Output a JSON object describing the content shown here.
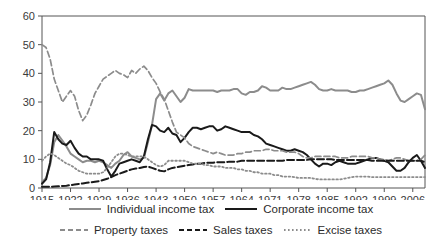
{
  "chart_data": {
    "type": "line",
    "title": "",
    "subtitle": "",
    "xlabel": "",
    "ylabel": "",
    "xlim": [
      1915,
      2009
    ],
    "ylim": [
      0,
      60
    ],
    "grid": false,
    "legend_position": "bottom",
    "y_ticks": [
      0,
      10,
      20,
      30,
      40,
      50,
      60
    ],
    "x_ticks": [
      1915,
      1922,
      1929,
      1936,
      1943,
      1950,
      1957,
      1964,
      1971,
      1978,
      1985,
      1992,
      1999,
      2006
    ],
    "x_tick_labels": [
      "1915",
      "1922",
      "1929",
      "1936",
      "1943",
      "1950",
      "1957",
      "1964",
      "1971",
      "1978",
      "1985",
      "1992",
      "1999",
      "2006"
    ],
    "y_tick_labels": [
      "0",
      "10",
      "20",
      "30",
      "40",
      "50",
      "60"
    ],
    "x": [
      1915,
      1916,
      1917,
      1918,
      1919,
      1920,
      1921,
      1922,
      1923,
      1924,
      1925,
      1926,
      1927,
      1928,
      1929,
      1930,
      1931,
      1932,
      1933,
      1934,
      1935,
      1936,
      1937,
      1938,
      1939,
      1940,
      1941,
      1942,
      1943,
      1944,
      1945,
      1946,
      1947,
      1948,
      1949,
      1950,
      1951,
      1952,
      1953,
      1954,
      1955,
      1956,
      1957,
      1958,
      1959,
      1960,
      1961,
      1962,
      1963,
      1964,
      1965,
      1966,
      1967,
      1968,
      1969,
      1970,
      1971,
      1972,
      1973,
      1974,
      1975,
      1976,
      1977,
      1978,
      1979,
      1980,
      1981,
      1982,
      1983,
      1984,
      1985,
      1986,
      1987,
      1988,
      1989,
      1990,
      1991,
      1992,
      1993,
      1994,
      1995,
      1996,
      1997,
      1998,
      1999,
      2000,
      2001,
      2002,
      2003,
      2004,
      2005,
      2006,
      2007,
      2008,
      2009
    ],
    "series": [
      {
        "name": "Individual income tax",
        "style": "solid",
        "color": "#8c8c8c",
        "width": 2,
        "values": [
          2.0,
          3.5,
          8.0,
          16.0,
          18.5,
          16.5,
          14.5,
          12.0,
          11.0,
          10.0,
          9.0,
          9.5,
          9.5,
          9.0,
          9.5,
          9.0,
          8.0,
          7.0,
          8.5,
          9.5,
          11.5,
          12.5,
          11.0,
          10.5,
          10.0,
          10.5,
          16.0,
          22.0,
          31.0,
          33.0,
          30.5,
          33.0,
          34.0,
          32.0,
          30.0,
          31.5,
          34.5,
          34.0,
          34.0,
          34.0,
          34.0,
          34.0,
          34.0,
          33.5,
          34.0,
          34.0,
          34.0,
          34.5,
          34.5,
          33.0,
          32.5,
          33.5,
          33.5,
          34.0,
          35.5,
          35.0,
          34.0,
          34.0,
          34.0,
          35.0,
          34.5,
          34.5,
          35.0,
          35.5,
          36.0,
          36.5,
          37.0,
          36.0,
          34.5,
          34.0,
          34.0,
          34.5,
          34.0,
          34.0,
          34.0,
          34.0,
          33.5,
          33.5,
          34.0,
          34.0,
          34.5,
          35.0,
          35.5,
          36.0,
          36.5,
          37.5,
          36.0,
          33.0,
          30.5,
          30.0,
          31.0,
          32.0,
          33.0,
          32.5,
          27.5
        ]
      },
      {
        "name": "Corporate income tax",
        "style": "solid",
        "color": "#1a1a1a",
        "width": 2,
        "values": [
          1.5,
          3.0,
          9.0,
          19.5,
          17.0,
          15.5,
          15.0,
          16.5,
          14.0,
          12.0,
          11.0,
          11.0,
          10.0,
          10.0,
          10.0,
          9.5,
          6.5,
          4.0,
          6.0,
          8.5,
          9.0,
          9.5,
          10.0,
          9.5,
          9.0,
          11.0,
          17.0,
          22.0,
          21.5,
          20.0,
          19.5,
          21.0,
          19.0,
          18.5,
          16.0,
          17.5,
          19.5,
          21.0,
          21.0,
          20.5,
          21.0,
          21.5,
          21.5,
          20.0,
          20.5,
          21.5,
          21.0,
          20.5,
          20.0,
          19.5,
          19.5,
          19.5,
          18.5,
          18.0,
          17.0,
          15.5,
          15.0,
          14.5,
          14.0,
          13.5,
          13.0,
          13.0,
          13.5,
          13.0,
          12.5,
          11.5,
          10.0,
          8.5,
          7.5,
          8.5,
          8.5,
          8.0,
          9.0,
          9.5,
          9.0,
          8.5,
          8.5,
          8.5,
          9.0,
          9.5,
          10.0,
          10.5,
          10.5,
          10.0,
          9.5,
          9.0,
          7.5,
          6.0,
          6.0,
          7.0,
          9.0,
          10.5,
          11.5,
          9.5,
          7.0
        ]
      },
      {
        "name": "Property taxes",
        "style": "dashed",
        "color": "#8c8c8c",
        "width": 1.7,
        "values": [
          50.0,
          49.0,
          45.0,
          38.0,
          34.0,
          30.0,
          32.0,
          34.0,
          32.0,
          27.0,
          23.5,
          25.5,
          29.0,
          33.0,
          35.5,
          38.0,
          39.0,
          40.0,
          41.0,
          40.0,
          39.5,
          38.5,
          41.0,
          40.0,
          41.5,
          42.5,
          41.0,
          38.5,
          36.5,
          33.5,
          31.0,
          27.0,
          23.0,
          19.5,
          18.5,
          17.5,
          15.5,
          14.5,
          14.0,
          13.5,
          13.0,
          12.5,
          12.0,
          12.5,
          12.0,
          11.5,
          11.5,
          11.5,
          12.0,
          12.0,
          12.5,
          12.5,
          13.0,
          13.0,
          13.0,
          13.5,
          13.5,
          13.0,
          13.0,
          13.0,
          12.5,
          12.5,
          12.5,
          12.0,
          11.0,
          10.5,
          10.5,
          11.0,
          11.0,
          11.0,
          11.0,
          11.0,
          11.0,
          10.5,
          10.5,
          10.5,
          11.0,
          11.0,
          11.0,
          11.0,
          11.0,
          10.5,
          10.5,
          10.0,
          10.0,
          9.5,
          10.0,
          10.5,
          10.5,
          10.0,
          9.5,
          9.5,
          9.5,
          10.0,
          11.5
        ]
      },
      {
        "name": "Sales taxes",
        "style": "dashed-heavy",
        "color": "#1a1a1a",
        "width": 2,
        "values": [
          0.4,
          0.4,
          0.4,
          0.5,
          0.6,
          0.7,
          0.8,
          1.0,
          1.2,
          1.4,
          1.6,
          1.8,
          2.0,
          2.2,
          2.4,
          2.8,
          3.2,
          3.8,
          4.5,
          5.0,
          5.5,
          6.0,
          6.5,
          6.8,
          7.0,
          7.3,
          7.5,
          7.0,
          6.5,
          6.0,
          5.8,
          6.5,
          7.0,
          7.2,
          7.5,
          7.8,
          8.0,
          8.2,
          8.5,
          8.5,
          8.8,
          8.8,
          8.8,
          9.0,
          9.0,
          9.0,
          9.2,
          9.2,
          9.2,
          9.5,
          9.5,
          9.5,
          9.5,
          9.5,
          9.5,
          9.5,
          9.5,
          9.5,
          9.5,
          9.5,
          9.8,
          9.8,
          9.8,
          9.8,
          9.8,
          9.8,
          10.0,
          10.0,
          10.0,
          10.0,
          10.0,
          10.0,
          9.8,
          9.8,
          9.8,
          9.8,
          9.8,
          9.8,
          9.8,
          9.8,
          9.8,
          9.5,
          9.5,
          9.5,
          9.5,
          9.5,
          9.5,
          9.5,
          9.5,
          9.5,
          9.5,
          9.5,
          9.5,
          9.5,
          9.0
        ]
      },
      {
        "name": "Excise taxes",
        "style": "dotted",
        "color": "#8c8c8c",
        "width": 1.8,
        "values": [
          9.5,
          11.0,
          12.0,
          11.5,
          10.5,
          9.5,
          8.5,
          8.0,
          7.0,
          6.0,
          5.5,
          5.0,
          5.0,
          5.0,
          5.0,
          5.5,
          7.0,
          9.0,
          11.0,
          12.0,
          12.0,
          11.5,
          11.0,
          11.0,
          11.0,
          11.0,
          10.0,
          9.0,
          8.0,
          7.5,
          8.0,
          9.5,
          9.5,
          9.5,
          9.5,
          9.5,
          9.0,
          8.5,
          8.5,
          8.5,
          8.0,
          8.0,
          7.5,
          7.5,
          7.5,
          7.0,
          7.0,
          7.0,
          6.5,
          6.5,
          6.0,
          6.0,
          5.5,
          5.5,
          5.0,
          5.0,
          5.0,
          4.5,
          4.5,
          4.0,
          4.0,
          4.0,
          3.8,
          3.5,
          3.5,
          3.5,
          3.5,
          3.2,
          3.0,
          3.0,
          3.0,
          3.0,
          3.0,
          3.0,
          3.2,
          3.5,
          3.8,
          4.0,
          4.0,
          4.0,
          4.0,
          3.8,
          3.8,
          3.8,
          3.8,
          3.8,
          3.8,
          3.8,
          3.8,
          3.8,
          3.8,
          3.8,
          3.8,
          3.8,
          3.8
        ]
      }
    ]
  },
  "legend": {
    "row1": [
      {
        "label": "Individual income tax",
        "swatch": "solid-gray"
      },
      {
        "label": "Corporate income tax",
        "swatch": "solid-black"
      }
    ],
    "row2": [
      {
        "label": "Property taxes",
        "swatch": "dashed-gray"
      },
      {
        "label": "Sales taxes",
        "swatch": "dashed-black"
      },
      {
        "label": "Excise taxes",
        "swatch": "dotted-gray"
      }
    ]
  }
}
